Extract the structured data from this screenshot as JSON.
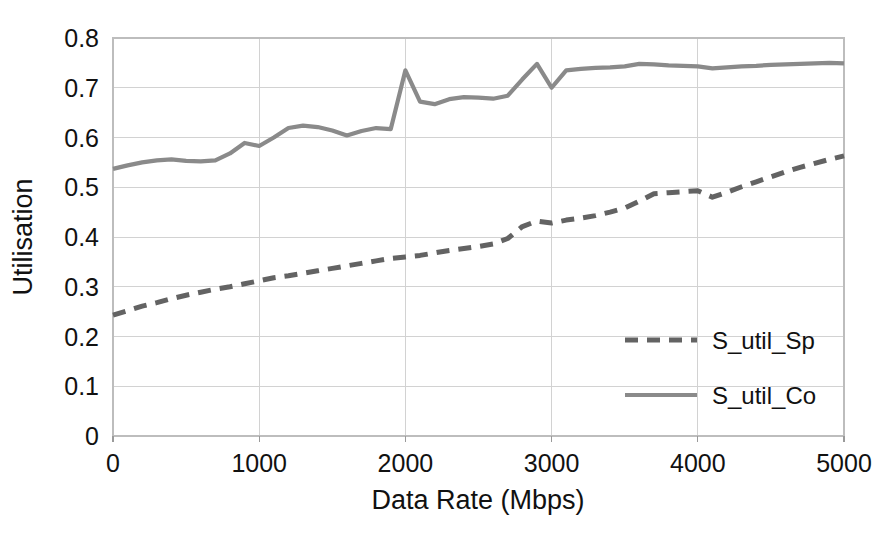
{
  "chart_data": {
    "type": "line",
    "title": "",
    "xlabel": "Data Rate (Mbps)",
    "ylabel": "Utilisation",
    "xlim": [
      0,
      5000
    ],
    "ylim": [
      0,
      0.8
    ],
    "grid": true,
    "legend_position": "inside-right",
    "xticks": [
      0,
      1000,
      2000,
      3000,
      4000,
      5000
    ],
    "xtick_labels": [
      "0",
      "1000",
      "2000",
      "3000",
      "4000",
      "5000"
    ],
    "yticks": [
      0,
      0.1,
      0.2,
      0.3,
      0.4,
      0.5,
      0.6,
      0.7,
      0.8
    ],
    "ytick_labels": [
      "0",
      "0.1",
      "0.2",
      "0.3",
      "0.4",
      "0.5",
      "0.6",
      "0.7",
      "0.8"
    ],
    "x": [
      0,
      100,
      200,
      300,
      400,
      500,
      600,
      700,
      800,
      900,
      1000,
      1100,
      1200,
      1300,
      1400,
      1500,
      1600,
      1700,
      1800,
      1900,
      2000,
      2100,
      2200,
      2300,
      2400,
      2500,
      2600,
      2700,
      2800,
      2900,
      3000,
      3100,
      3200,
      3300,
      3400,
      3500,
      3600,
      3700,
      3800,
      3900,
      4000,
      4100,
      4200,
      4300,
      4400,
      4500,
      4600,
      4700,
      4800,
      4900,
      5000
    ],
    "series": [
      {
        "name": "S_util_Sp",
        "style": "dashed",
        "color": "#636363",
        "values": [
          0.243,
          0.252,
          0.261,
          0.268,
          0.276,
          0.283,
          0.289,
          0.295,
          0.3,
          0.306,
          0.312,
          0.318,
          0.322,
          0.327,
          0.332,
          0.337,
          0.342,
          0.347,
          0.352,
          0.357,
          0.36,
          0.363,
          0.368,
          0.373,
          0.377,
          0.381,
          0.386,
          0.397,
          0.421,
          0.432,
          0.428,
          0.434,
          0.438,
          0.443,
          0.45,
          0.458,
          0.472,
          0.487,
          0.489,
          0.491,
          0.493,
          0.48,
          0.49,
          0.501,
          0.511,
          0.521,
          0.531,
          0.54,
          0.548,
          0.556,
          0.563
        ]
      },
      {
        "name": "S_util_Co",
        "style": "solid",
        "color": "#8a8a8a",
        "values": [
          0.537,
          0.544,
          0.55,
          0.554,
          0.556,
          0.553,
          0.552,
          0.554,
          0.568,
          0.589,
          0.583,
          0.6,
          0.619,
          0.624,
          0.621,
          0.614,
          0.604,
          0.613,
          0.619,
          0.617,
          0.735,
          0.672,
          0.667,
          0.677,
          0.681,
          0.68,
          0.678,
          0.684,
          0.717,
          0.748,
          0.7,
          0.735,
          0.738,
          0.74,
          0.741,
          0.743,
          0.748,
          0.747,
          0.745,
          0.744,
          0.743,
          0.739,
          0.741,
          0.743,
          0.744,
          0.746,
          0.747,
          0.748,
          0.749,
          0.75,
          0.749
        ]
      }
    ],
    "legend": [
      {
        "label": "S_util_Sp",
        "style": "dashed",
        "color": "#636363"
      },
      {
        "label": "S_util_Co",
        "style": "solid",
        "color": "#8a8a8a"
      }
    ]
  }
}
